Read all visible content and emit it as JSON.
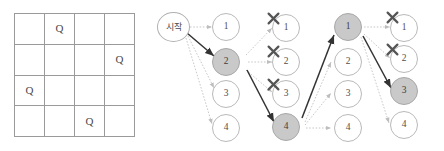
{
  "figure": {
    "language": "ko"
  },
  "board": {
    "size": 4,
    "queen_glyph": "Q",
    "queen_positions": [
      {
        "row": 1,
        "col": 2
      },
      {
        "row": 2,
        "col": 4
      },
      {
        "row": 3,
        "col": 1
      },
      {
        "row": 4,
        "col": 3
      }
    ],
    "cells": [
      [
        "",
        "Q",
        "",
        ""
      ],
      [
        "",
        "",
        "",
        "Q"
      ],
      [
        "Q",
        "",
        "",
        ""
      ],
      [
        "",
        "",
        "Q",
        ""
      ]
    ],
    "border_color": "#9a9a9a"
  },
  "tree": {
    "start_label": "시작",
    "selected_fill": "#c9c9c9",
    "node_border": "#b9b9b9",
    "solid_edge_color": "#333333",
    "dotted_edge_color": "#c2c2c2",
    "x_mark_color": "#555555",
    "x_mark_glyph": "x-mark",
    "columns": [
      {
        "index": 1,
        "nodes": [
          {
            "label": "1",
            "selected": false,
            "blocked": false
          },
          {
            "label": "2",
            "selected": true,
            "blocked": false
          },
          {
            "label": "3",
            "selected": false,
            "blocked": false
          },
          {
            "label": "4",
            "selected": false,
            "blocked": false
          }
        ]
      },
      {
        "index": 2,
        "nodes": [
          {
            "label": "1",
            "selected": false,
            "blocked": true
          },
          {
            "label": "2",
            "selected": false,
            "blocked": true
          },
          {
            "label": "3",
            "selected": false,
            "blocked": true
          },
          {
            "label": "4",
            "selected": true,
            "blocked": false
          }
        ]
      },
      {
        "index": 3,
        "nodes": [
          {
            "label": "1",
            "selected": true,
            "blocked": false
          },
          {
            "label": "2",
            "selected": false,
            "blocked": false
          },
          {
            "label": "3",
            "selected": false,
            "blocked": false
          },
          {
            "label": "4",
            "selected": false,
            "blocked": false
          }
        ]
      },
      {
        "index": 4,
        "nodes": [
          {
            "label": "1",
            "selected": false,
            "blocked": true
          },
          {
            "label": "2",
            "selected": false,
            "blocked": true
          },
          {
            "label": "3",
            "selected": true,
            "blocked": false
          },
          {
            "label": "4",
            "selected": false,
            "blocked": false
          }
        ]
      }
    ],
    "solution_path": [
      "시작",
      "2",
      "4",
      "1",
      "3"
    ]
  }
}
